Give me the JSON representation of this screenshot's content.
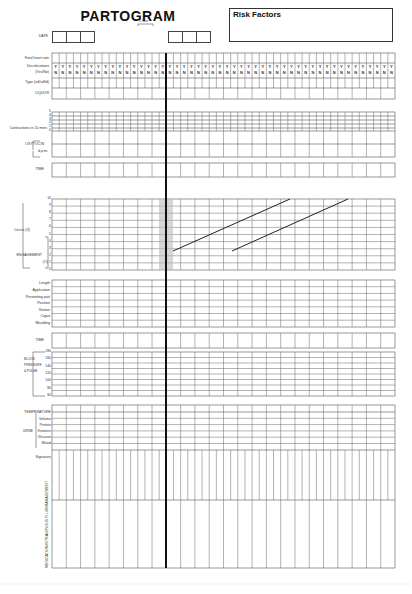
{
  "header": {
    "title": "PARTOGRAM",
    "risk_factors_label": "Risk Factors",
    "date_label": "DATE",
    "one_hour_label": "1 hour"
  },
  "fetal": {
    "rows": [
      "Fetal heart rate",
      "Decelerations",
      "(Yes/No)",
      "Type (ed/vd/ld)",
      "LIQUOR"
    ],
    "yes": "Y",
    "no": "N"
  },
  "contractions": {
    "label": "Contractions in 10 mins",
    "ticks": [
      "5",
      "4",
      "3",
      "2",
      "1",
      "0"
    ]
  },
  "oxytocin": {
    "label": "OXYTOCIN",
    "unit": "d.p.m."
  },
  "time_label": "TIME",
  "cervix": {
    "label": "Cervix (X)",
    "engagement_label": "ENGAGEMENT",
    "engagement_unit": "(O)",
    "ticks": [
      "10",
      "9",
      "8",
      "7",
      "6",
      "5",
      "4",
      "3",
      "2",
      "1",
      "0"
    ],
    "alert_line": "alert",
    "action_line": "action"
  },
  "descent": {
    "rows": [
      "Length",
      "Application",
      "Presenting part",
      "Position",
      "Station",
      "Caput",
      "Moulding"
    ]
  },
  "time2_label": "TIME",
  "vitals": {
    "label_lines": [
      "BLOOD",
      "PRESSURE",
      "& PULSE"
    ],
    "ticks": [
      "180",
      "160",
      "140",
      "120",
      "100",
      "80",
      "60"
    ],
    "marker_bp": "↕",
    "marker_pulse": "•"
  },
  "urine": {
    "temperature_label": "TEMPERATURE",
    "urine_label": "URINE",
    "rows": [
      "Volume",
      "Protein",
      "Ketones",
      "Glucose",
      "Blood"
    ]
  },
  "signature_label": "Signature",
  "medication_label": "MEDICATION/INTRAVENOUS FLUID/MANAGEMENT"
}
